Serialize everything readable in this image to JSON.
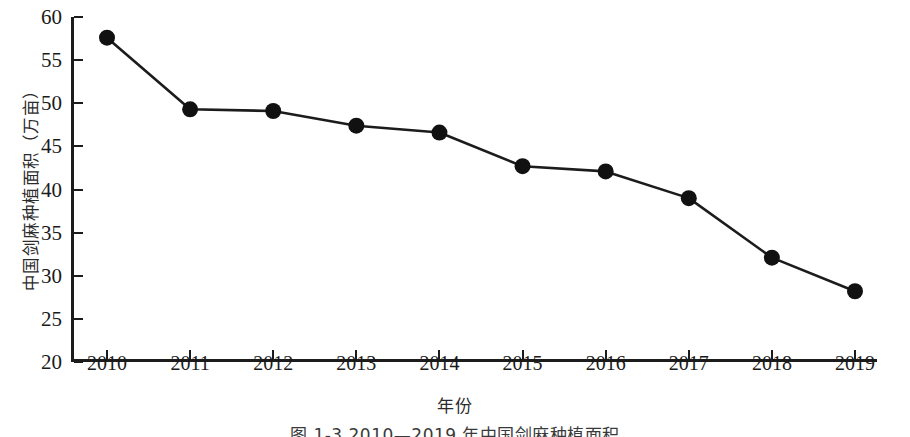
{
  "chart_data": {
    "type": "line",
    "title": "",
    "subtitle": "",
    "xlabel": "年份",
    "ylabel": "中国剑麻种植面积（万亩）",
    "categories": [
      "2010",
      "2011",
      "2012",
      "2013",
      "2014",
      "2015",
      "2016",
      "2017",
      "2018",
      "2019"
    ],
    "x": [
      2010,
      2011,
      2012,
      2013,
      2014,
      2015,
      2016,
      2017,
      2018,
      2019
    ],
    "values": [
      57.6,
      49.3,
      49.1,
      47.4,
      46.6,
      42.7,
      42.1,
      39.0,
      32.1,
      28.2
    ],
    "series": [
      {
        "name": "中国剑麻种植面积",
        "values": [
          57.6,
          49.3,
          49.1,
          47.4,
          46.6,
          42.7,
          42.1,
          39.0,
          32.1,
          28.2
        ]
      }
    ],
    "ylim": [
      20,
      60
    ],
    "xlim": [
      2010,
      2019
    ],
    "yticks": [
      20,
      25,
      30,
      35,
      40,
      45,
      50,
      55,
      60
    ],
    "ytick_labels": [
      "20",
      "25",
      "30",
      "35",
      "40",
      "45",
      "50",
      "55",
      "60"
    ],
    "xticks": [
      2010,
      2011,
      2012,
      2013,
      2014,
      2015,
      2016,
      2017,
      2018,
      2019
    ],
    "grid": false,
    "legend": "none",
    "marker": "circle",
    "line_color": "#1c1c1c",
    "marker_color": "#111111"
  },
  "figure": {
    "caption": "图 1-3  2010—2019 年中国剑麻种植面积"
  },
  "axis_titles": {
    "y": "中国剑麻种植面积（万亩）",
    "x": "年份"
  }
}
